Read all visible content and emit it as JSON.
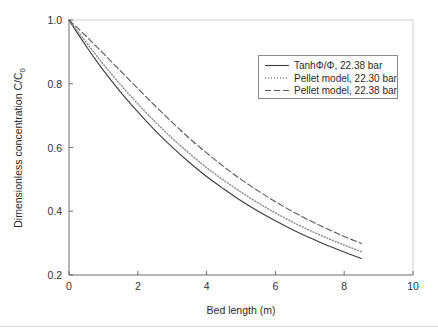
{
  "figure": {
    "background_color": "#ffffff",
    "axis_color": "#6f6f6f",
    "text_color": "#2b2b2b"
  },
  "chart_data": {
    "type": "line",
    "title": "",
    "xlabel": "Bed length (m)",
    "ylabel": "Dimensionless concentration C/C",
    "ylabel_subscript": "0",
    "xlim": [
      0,
      10
    ],
    "ylim": [
      0.2,
      1.0
    ],
    "xticks": [
      0,
      2,
      4,
      6,
      8,
      10
    ],
    "xtick_labels": [
      "0",
      "2",
      "4",
      "6",
      "8",
      "10"
    ],
    "yticks": [
      0.2,
      0.4,
      0.6,
      0.8,
      1.0
    ],
    "ytick_labels": [
      "0.2",
      "0.4",
      "0.6",
      "0.8",
      "1.0"
    ],
    "grid": false,
    "legend_position": "upper right",
    "series": [
      {
        "name": "TanhΦ/Φ, 22.38 bar",
        "style": "solid",
        "color": "#3c3c3c",
        "x": [
          0.0,
          0.25,
          0.5,
          0.75,
          1.0,
          1.5,
          2.0,
          2.5,
          3.0,
          3.5,
          4.0,
          4.5,
          5.0,
          5.5,
          6.0,
          6.5,
          7.0,
          7.5,
          8.0,
          8.5
        ],
        "y": [
          1.0,
          0.958,
          0.918,
          0.879,
          0.842,
          0.774,
          0.712,
          0.654,
          0.601,
          0.553,
          0.509,
          0.47,
          0.433,
          0.4,
          0.37,
          0.342,
          0.317,
          0.293,
          0.272,
          0.252
        ]
      },
      {
        "name": "Pellet model, 22.30 bar",
        "style": "dotted",
        "color": "#8a8a8a",
        "x": [
          0.0,
          0.25,
          0.5,
          0.75,
          1.0,
          1.5,
          2.0,
          2.5,
          3.0,
          3.5,
          4.0,
          4.5,
          5.0,
          5.5,
          6.0,
          6.5,
          7.0,
          7.5,
          8.0,
          8.5
        ],
        "y": [
          1.0,
          0.965,
          0.93,
          0.895,
          0.861,
          0.797,
          0.737,
          0.681,
          0.629,
          0.581,
          0.537,
          0.497,
          0.46,
          0.426,
          0.395,
          0.366,
          0.34,
          0.316,
          0.294,
          0.273
        ]
      },
      {
        "name": "Pellet model, 22.38 bar",
        "style": "dashed",
        "color": "#5a5a5a",
        "x": [
          0.0,
          0.25,
          0.5,
          0.75,
          1.0,
          1.5,
          2.0,
          2.5,
          3.0,
          3.5,
          4.0,
          4.5,
          5.0,
          5.5,
          6.0,
          6.5,
          7.0,
          7.5,
          8.0,
          8.5
        ],
        "y": [
          1.0,
          0.975,
          0.949,
          0.922,
          0.895,
          0.84,
          0.785,
          0.731,
          0.679,
          0.629,
          0.583,
          0.54,
          0.5,
          0.464,
          0.43,
          0.399,
          0.371,
          0.345,
          0.321,
          0.299
        ]
      }
    ]
  },
  "legend": {
    "entries": [
      {
        "label": "TanhΦ/Φ, 22.38 bar",
        "style": "solid"
      },
      {
        "label": "Pellet model, 22.30 bar",
        "style": "dotted"
      },
      {
        "label": "Pellet model, 22.38 bar",
        "style": "dashed"
      }
    ]
  }
}
